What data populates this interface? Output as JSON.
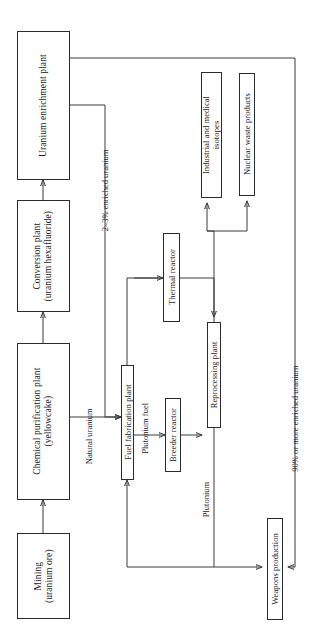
{
  "diagram": {
    "orientation": "rotated-90-ccw",
    "line_color": "#3a3a3a",
    "box_border_color": "#2b2b2b",
    "background": "#ffffff",
    "nodes": [
      {
        "id": "uranium-enrichment-plant",
        "label": "Uranium enrichment plant"
      },
      {
        "id": "conversion-plant",
        "label": "Conversion plant\n(uranium hexafluoride)",
        "line1": "Conversion plant",
        "line2": "(uranium hexafluoride)"
      },
      {
        "id": "chemical-purification-plant",
        "label": "Chemical purification plant\n(yellowcake)",
        "line1": "Chemical purification plant",
        "line2": "(yellowcake)"
      },
      {
        "id": "mining",
        "label": "Mining\n(uranium ore)",
        "line1": "Mining",
        "line2": "(uranium ore)"
      },
      {
        "id": "fuel-fabrication-plant",
        "label": "Fuel fabrication plant"
      },
      {
        "id": "thermal-reactor",
        "label": "Thermal reactor"
      },
      {
        "id": "breeder-reactor",
        "label": "Breeder reactor"
      },
      {
        "id": "reprocessing-plant",
        "label": "Reprocessing plant"
      },
      {
        "id": "industrial-and-medical-isotopes",
        "label": "Industrial and medical\nisotopes",
        "line1": "Industrial and medical",
        "line2": "isotopes"
      },
      {
        "id": "nuclear-waste-products",
        "label": "Nuclear waste products"
      },
      {
        "id": "weapons-production",
        "label": "Weapons production"
      }
    ],
    "edge_labels": [
      {
        "id": "enriched-uranium-2-3",
        "text": "2–3% enriched uranium"
      },
      {
        "id": "natural-uranium",
        "text": "Natural uranium"
      },
      {
        "id": "plutonium-fuel",
        "text": "Plutonium fuel"
      },
      {
        "id": "plutonium",
        "text": "Plutonium"
      },
      {
        "id": "enriched-uranium-90",
        "text": "90% or more enriched uranium"
      }
    ]
  }
}
